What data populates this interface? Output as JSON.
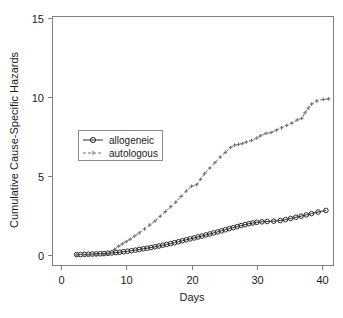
{
  "chart_data": {
    "type": "line",
    "title": "",
    "subtitle": "",
    "xlabel": "Days",
    "ylabel": "Cumulative Cause-Specific Hazards",
    "xlim": [
      0,
      42
    ],
    "ylim": [
      0,
      15
    ],
    "xticks": [
      0,
      10,
      20,
      30,
      40
    ],
    "yticks": [
      0,
      5,
      10,
      15
    ],
    "xtick_labels": [
      "0",
      "10",
      "20",
      "30",
      "40"
    ],
    "ytick_labels": [
      "0",
      "5",
      "10",
      "15"
    ],
    "grid": false,
    "legend_position": "center-left",
    "legend": [
      "allogeneic",
      "autologous"
    ],
    "series": [
      {
        "name": "allogeneic",
        "marker": "circle",
        "linestyle": "solid",
        "color": "#2b2b2b",
        "x": [
          2.4,
          3.0,
          3.6,
          4.2,
          4.8,
          5.4,
          6.0,
          6.6,
          7.2,
          7.8,
          8.4,
          9.0,
          9.6,
          10.2,
          10.8,
          11.4,
          12.0,
          12.6,
          13.2,
          13.8,
          14.4,
          15.0,
          15.6,
          16.2,
          16.8,
          17.4,
          18.0,
          18.6,
          19.2,
          19.8,
          20.4,
          21.0,
          21.6,
          22.2,
          22.8,
          23.4,
          24.0,
          24.6,
          25.2,
          25.8,
          26.4,
          27.0,
          27.6,
          28.2,
          28.8,
          29.4,
          30.0,
          30.8,
          31.6,
          32.6,
          33.6,
          34.4,
          35.2,
          36.0,
          36.8,
          37.6,
          38.4,
          39.4,
          40.6
        ],
        "y": [
          0.02,
          0.03,
          0.04,
          0.05,
          0.06,
          0.07,
          0.08,
          0.09,
          0.11,
          0.13,
          0.15,
          0.18,
          0.21,
          0.24,
          0.27,
          0.31,
          0.35,
          0.39,
          0.43,
          0.47,
          0.52,
          0.57,
          0.62,
          0.67,
          0.72,
          0.78,
          0.84,
          0.9,
          0.96,
          1.02,
          1.08,
          1.14,
          1.2,
          1.27,
          1.33,
          1.4,
          1.46,
          1.53,
          1.6,
          1.67,
          1.73,
          1.8,
          1.86,
          1.92,
          1.98,
          2.03,
          2.07,
          2.1,
          2.12,
          2.14,
          2.18,
          2.24,
          2.31,
          2.39,
          2.46,
          2.54,
          2.62,
          2.72,
          2.82
        ]
      },
      {
        "name": "autologous",
        "marker": "plus",
        "linestyle": "dashed",
        "color": "#6e6e6e",
        "x": [
          2.4,
          3.4,
          4.4,
          5.4,
          6.4,
          7.4,
          8.2,
          8.8,
          9.4,
          10.0,
          10.6,
          11.3,
          12.0,
          12.8,
          13.6,
          14.4,
          15.2,
          16.0,
          16.8,
          17.6,
          18.4,
          19.2,
          20.0,
          20.8,
          21.4,
          22.0,
          22.8,
          23.6,
          24.4,
          25.2,
          26.0,
          26.6,
          27.2,
          27.8,
          28.4,
          29.2,
          30.0,
          30.6,
          31.4,
          32.2,
          33.0,
          33.8,
          34.6,
          35.4,
          36.2,
          36.9,
          37.4,
          37.9,
          38.4,
          39.2,
          40.2,
          41.0
        ],
        "y": [
          0.0,
          0.0,
          0.0,
          0.0,
          0.02,
          0.05,
          0.35,
          0.55,
          0.7,
          0.85,
          1.0,
          1.2,
          1.4,
          1.65,
          1.9,
          2.15,
          2.45,
          2.75,
          3.05,
          3.35,
          3.7,
          4.05,
          4.35,
          4.45,
          4.8,
          5.15,
          5.5,
          5.85,
          6.2,
          6.5,
          6.8,
          6.95,
          7.0,
          7.05,
          7.15,
          7.25,
          7.4,
          7.55,
          7.7,
          7.75,
          7.9,
          8.05,
          8.2,
          8.35,
          8.55,
          8.65,
          9.0,
          9.3,
          9.55,
          9.75,
          9.85,
          9.88
        ]
      }
    ]
  },
  "axes": {
    "x_label": "Days",
    "y_label": "Cumulative Cause-Specific Hazards"
  },
  "legend": {
    "items": [
      {
        "label": "allogeneic",
        "marker": "circle-marker",
        "style": "solid"
      },
      {
        "label": "autologous",
        "marker": "plus-marker",
        "style": "dashed"
      }
    ]
  },
  "colors": {
    "allogeneic": "#2b2b2b",
    "autologous": "#6e6e6e",
    "axis": "#808080",
    "background": "#ffffff"
  }
}
